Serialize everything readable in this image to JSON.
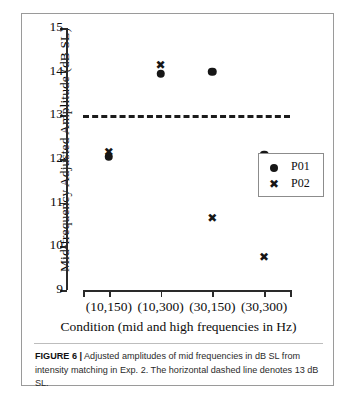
{
  "figure": {
    "caption_label": "FIGURE 6 |",
    "caption_text": " Adjusted amplitudes of mid frequencies in dB SL from intensity matching in Exp. 2. The horizontal dashed line denotes 13 dB SL."
  },
  "legend": {
    "entries": [
      {
        "label": "P01",
        "marker": "circle-marker"
      },
      {
        "label": "P02",
        "marker": "x-marker"
      }
    ]
  },
  "chart_data": {
    "type": "scatter",
    "title": "",
    "xlabel": "Condition (mid and high frequencies in Hz)",
    "ylabel": "Mid-frequency Adjusted Amplitude (dB SL)",
    "categories": [
      "(10,150)",
      "(10,300)",
      "(30,150)",
      "(30,300)"
    ],
    "ylim": [
      9,
      15
    ],
    "yticks": [
      9,
      10,
      11,
      12,
      13,
      14,
      15
    ],
    "ytick_labels": [
      "9",
      "10",
      "11",
      "12",
      "13",
      "14",
      "15"
    ],
    "grid": false,
    "legend_position": "right-middle",
    "series": [
      {
        "name": "P01",
        "marker": "circle",
        "color": "#161616",
        "values": [
          12.05,
          13.95,
          14.0,
          12.1
        ]
      },
      {
        "name": "P02",
        "marker": "x",
        "color": "#161616",
        "values": [
          12.15,
          14.15,
          10.65,
          9.75
        ]
      }
    ],
    "annotations": [
      {
        "type": "hline",
        "value": 13,
        "style": "dashed",
        "label": "13 dB SL"
      }
    ]
  }
}
